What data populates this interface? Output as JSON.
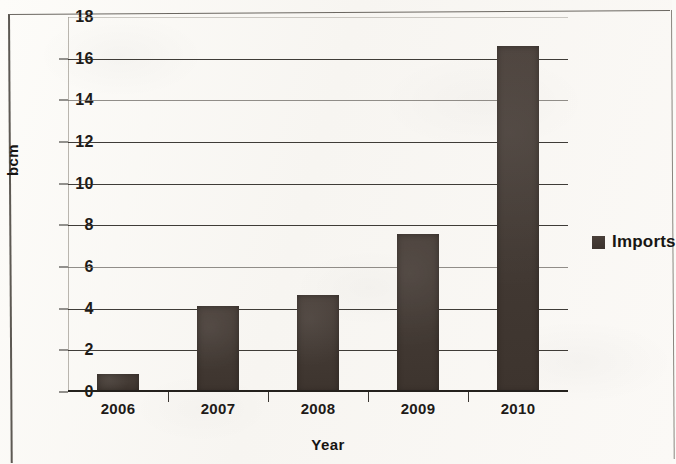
{
  "chart_data": {
    "type": "bar",
    "title": "",
    "xlabel": "Year",
    "ylabel": "bcm",
    "categories": [
      "2006",
      "2007",
      "2008",
      "2009",
      "2010"
    ],
    "series": [
      {
        "name": "Imports",
        "values": [
          0.85,
          4.15,
          4.65,
          7.6,
          16.6
        ]
      }
    ],
    "ylim": [
      0,
      18
    ],
    "yticks": [
      "0",
      "2",
      "4",
      "6",
      "8",
      "10",
      "12",
      "14",
      "16",
      "18"
    ],
    "ytick_values": [
      0,
      2,
      4,
      6,
      8,
      10,
      12,
      14,
      16,
      18
    ],
    "grid": "horizontal",
    "legend": {
      "position": "right",
      "entries": [
        {
          "label": "Imports",
          "color": "#433a34"
        }
      ]
    },
    "bar_color": "#433a34",
    "background_color": "#fbfaf7"
  }
}
